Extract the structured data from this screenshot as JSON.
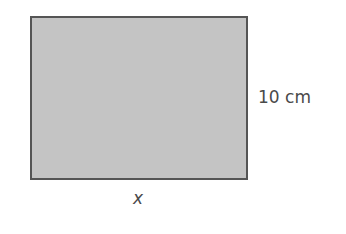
{
  "diagram": {
    "shape": "rectangle",
    "fill_color": "#c4c4c4",
    "border_color": "#555555",
    "height_label": "10 cm",
    "width_label": "x"
  }
}
